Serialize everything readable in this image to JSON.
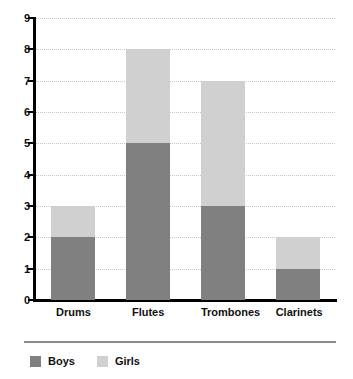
{
  "chart_data": {
    "type": "bar",
    "subtype": "stacked-vertical-bar",
    "title": "",
    "xlabel": "",
    "ylabel": "",
    "ylim": [
      0,
      9
    ],
    "ytick_labels": [
      "9",
      "8",
      "7",
      "6",
      "5",
      "4",
      "3",
      "2",
      "1",
      "0"
    ],
    "ytick_values": [
      9,
      8,
      7,
      6,
      5,
      4,
      3,
      2,
      1,
      0
    ],
    "grid": true,
    "grid_style": "dotted",
    "legend_position": "bottom-left",
    "categories": [
      "Drums",
      "Flutes",
      "Trombones",
      "Clarinets"
    ],
    "series": [
      {
        "name": "Boys",
        "color": "#808080",
        "values": [
          2,
          5,
          3,
          1
        ]
      },
      {
        "name": "Girls",
        "color": "#d0d0d0",
        "values": [
          1,
          3,
          4,
          1
        ]
      }
    ],
    "totals": [
      3,
      8,
      7,
      2
    ]
  },
  "legend": {
    "items": [
      {
        "label": "Boys",
        "color": "#808080"
      },
      {
        "label": "Girls",
        "color": "#d0d0d0"
      }
    ]
  },
  "colors": {
    "boys": "#808080",
    "girls": "#d0d0d0",
    "axis": "#000000",
    "grid": "#c8c8c8",
    "text": "#111111",
    "background": "#ffffff",
    "legend_rule": "#8a8a8a"
  }
}
